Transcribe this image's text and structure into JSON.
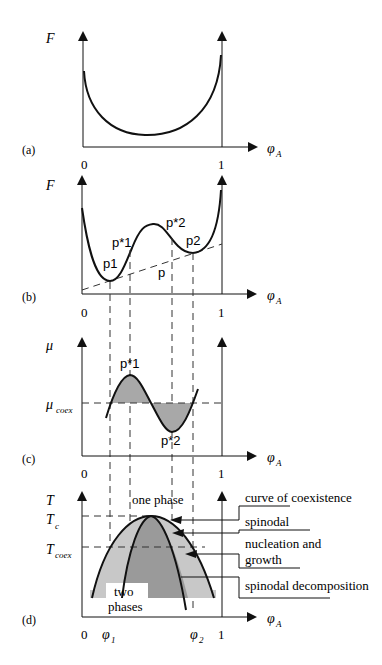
{
  "panels": {
    "a": {
      "label": "(a)",
      "y_axis": "F",
      "x_axis": "φ",
      "x_axis_sub": "A",
      "ticks": [
        "0",
        "1"
      ]
    },
    "b": {
      "label": "(b)",
      "y_axis": "F",
      "x_axis": "φ",
      "x_axis_sub": "A",
      "ticks": [
        "0",
        "1"
      ],
      "points": {
        "p1": "p1",
        "pstar1": "p*1",
        "pstar2": "p*2",
        "p2": "p2",
        "p": "p"
      }
    },
    "c": {
      "label": "(c)",
      "y_axis": "μ",
      "mu_coex": "μ",
      "mu_coex_sub": "coex",
      "x_axis": "φ",
      "x_axis_sub": "A",
      "ticks": [
        "0",
        "1"
      ],
      "points": {
        "pstar1": "p*1",
        "pstar2": "p*2"
      }
    },
    "d": {
      "label": "(d)",
      "y_axis": "T",
      "tc": "T",
      "tc_sub": "c",
      "tcoex": "T",
      "tcoex_sub": "coex",
      "x_axis": "φ",
      "x_axis_sub": "A",
      "ticks": [
        "0",
        "1"
      ],
      "phi1": "φ",
      "phi1_sub": "1",
      "phi2": "φ",
      "phi2_sub": "2",
      "one_phase": "one phase",
      "two_phases_1": "two",
      "two_phases_2": "phases",
      "legend": {
        "coexistence": "curve of coexistence",
        "spinodal": "spinodal",
        "nucleation_1": "nucleation and",
        "nucleation_2": "growth",
        "spinodal_decomp": "spinodal decomposition"
      }
    }
  },
  "colors": {
    "line": "#111111",
    "light_fill": "#c8c8c8",
    "dark_fill": "#9a9a9a",
    "dash": "#333333"
  }
}
